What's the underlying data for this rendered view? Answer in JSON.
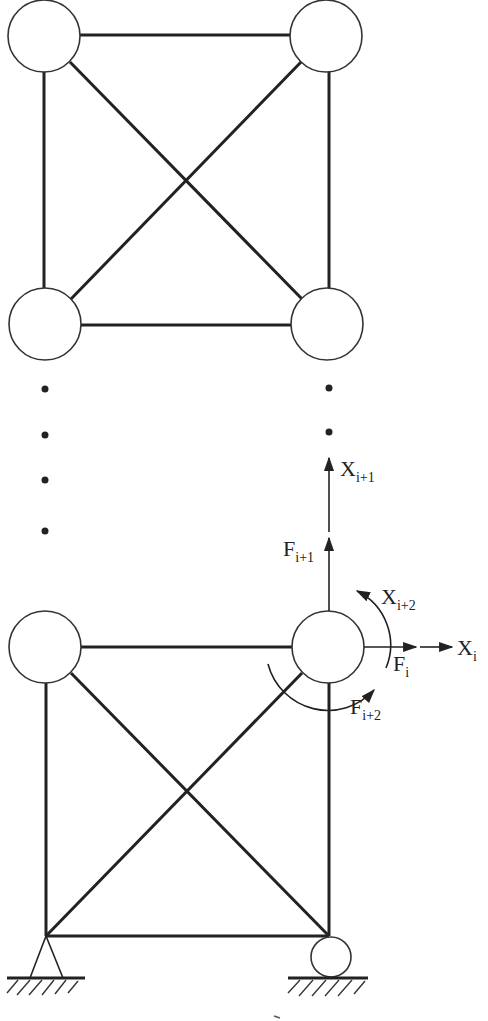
{
  "figure": {
    "labels": {
      "x_i1": {
        "main": "X",
        "sub": "i+1"
      },
      "f_i1": {
        "main": "F",
        "sub": "i+1"
      },
      "x_i2": {
        "main": "X",
        "sub": "i+2"
      },
      "x_i": {
        "main": "X",
        "sub": "i"
      },
      "f_i": {
        "main": "F",
        "sub": "i"
      },
      "f_i2": {
        "main": "F",
        "sub": "i+2"
      }
    },
    "supports": {
      "left": "pin",
      "right": "roller"
    },
    "continuation": "ellipsis dots between panels",
    "colors": {
      "ink": "#222222",
      "background": "#ffffff"
    }
  }
}
